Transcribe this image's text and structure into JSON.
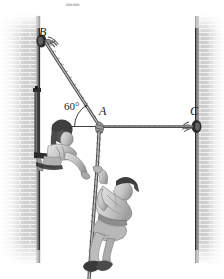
{
  "figure": {
    "kind": "statics-free-body-illustration",
    "background_color": "#ffffff",
    "width": 224,
    "height": 279,
    "topmark": "▂▂",
    "labels": {
      "point_b": "B",
      "point_a": "A",
      "point_c": "C",
      "angle": "60°"
    },
    "geometry": {
      "point_b": {
        "x": 44,
        "y": 41
      },
      "point_a": {
        "x": 99,
        "y": 126
      },
      "point_c": {
        "x": 198,
        "y": 126
      },
      "angle_value_deg": 60,
      "angle_arc_radius": 26,
      "rope_down_from_a_to": {
        "x": 88,
        "y": 279
      }
    },
    "walls": {
      "left": {
        "x": 36,
        "y": 14,
        "width": 6,
        "height": 251
      },
      "right": {
        "x": 196,
        "y": 14,
        "width": 6,
        "height": 251
      },
      "brick_color": "#c7c7c7",
      "mortar_color": "#f2f2f2",
      "edge_color": "#3a3a3a",
      "brick_width": 10,
      "brick_height": 4
    },
    "colors": {
      "rope": "#8d8d8d",
      "rope_dark": "#5a5a5a",
      "ink": "#1b1b1b",
      "skin": "#cfcfcf",
      "shirt": "#d9d9d9",
      "hair": "#4a4a4a",
      "pants": "#bdbdbd",
      "anchor": "#3d3d3d"
    },
    "people": [
      {
        "id": "woman-on-ledge",
        "description": "woman leaning out from left-wall ledge reaching toward rope",
        "anchor": {
          "x": 58,
          "y": 150
        }
      },
      {
        "id": "man-on-rope",
        "description": "man hanging and climbing on the vertical rope below point A",
        "anchor": {
          "x": 108,
          "y": 210
        }
      }
    ],
    "hardware": [
      {
        "id": "anchor-b",
        "at": {
          "x": 41,
          "y": 41
        },
        "wall": "left"
      },
      {
        "id": "anchor-c",
        "at": {
          "x": 197,
          "y": 126
        },
        "wall": "right"
      },
      {
        "id": "ledge-bracket",
        "at": {
          "x": 40,
          "y": 88
        },
        "wall": "left"
      }
    ]
  }
}
